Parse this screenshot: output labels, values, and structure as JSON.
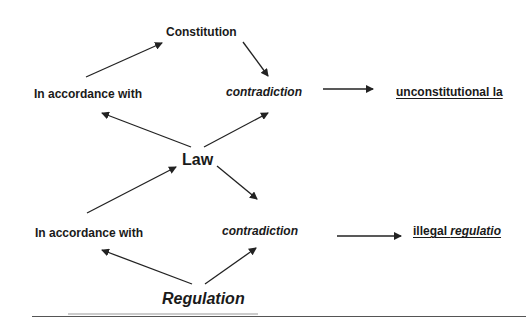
{
  "diagram": {
    "nodes": {
      "constitution": "Constitution",
      "in_accordance_top": "In accordance with",
      "contradiction_top": "contradiction",
      "unconstitutional_law": "unconstitutional la",
      "law": "Law",
      "in_accordance_bottom": "In accordance with",
      "contradiction_bottom": "contradiction",
      "illegal_prefix": "illegal ",
      "illegal_suffix": "regulatio",
      "regulation": "Regulation"
    },
    "edges": [
      {
        "from": "in_accordance_top",
        "to": "constitution"
      },
      {
        "from": "constitution",
        "to": "contradiction_top"
      },
      {
        "from": "contradiction_top",
        "to": "unconstitutional_law"
      },
      {
        "from": "law",
        "to": "in_accordance_top"
      },
      {
        "from": "law",
        "to": "contradiction_top"
      },
      {
        "from": "in_accordance_bottom",
        "to": "law"
      },
      {
        "from": "law",
        "to": "contradiction_bottom"
      },
      {
        "from": "contradiction_bottom",
        "to": "illegal_regulation"
      },
      {
        "from": "regulation",
        "to": "in_accordance_bottom"
      },
      {
        "from": "regulation",
        "to": "contradiction_bottom"
      }
    ],
    "colors": {
      "text": "#1a1a1a",
      "arrow": "#222222",
      "background": "#ffffff"
    }
  }
}
